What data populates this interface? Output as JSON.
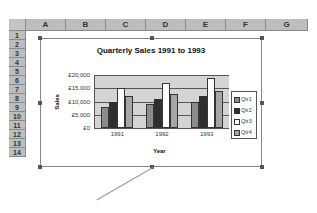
{
  "spreadsheet": {
    "columns": [
      "A",
      "B",
      "C",
      "D",
      "E",
      "F",
      "G"
    ],
    "rows": [
      "1",
      "2",
      "3",
      "4",
      "5",
      "6",
      "7",
      "8",
      "9",
      "10",
      "11",
      "12",
      "13",
      "14"
    ]
  },
  "chart_data": {
    "type": "bar",
    "title": "Quarterly Sales 1991 to 1993",
    "xlabel": "Year",
    "ylabel": "Sales",
    "categories": [
      "1991",
      "1992",
      "1993"
    ],
    "series": [
      {
        "name": "Qtr1",
        "values": [
          8000,
          9000,
          10000
        ],
        "color": "#8c8c8c"
      },
      {
        "name": "Qtr2",
        "values": [
          10000,
          11000,
          12000
        ],
        "color": "#2e2e2e"
      },
      {
        "name": "Qtr3",
        "values": [
          15000,
          17000,
          19000
        ],
        "color": "#ffffff"
      },
      {
        "name": "Qtr4",
        "values": [
          12000,
          13000,
          14000
        ],
        "color": "#a6a6a6"
      }
    ],
    "yticks": [
      "£0",
      "£5,000",
      "£10,000",
      "£15,000",
      "£20,000"
    ],
    "ylim": [
      0,
      20000
    ],
    "grid": true,
    "legend_position": "right",
    "plot_background": "#d4d4d4"
  }
}
